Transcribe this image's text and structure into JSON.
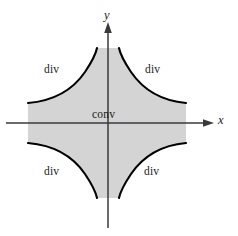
{
  "figure": {
    "type": "math-region-diagram",
    "width": 238,
    "height": 236,
    "background_color": "#ffffff"
  },
  "axes": {
    "x_label": "x",
    "y_label": "y",
    "origin": {
      "x": 108,
      "y": 123
    },
    "axis_color": "#3a3a3a",
    "x_axis": {
      "start_x": 6,
      "end_x": 214,
      "y": 123,
      "arrow": "right"
    },
    "y_axis": {
      "start_y": 228,
      "end_y": 22,
      "x": 108,
      "arrow": "up"
    }
  },
  "regions": {
    "convergent": {
      "label": "conv",
      "fill_color": "#d4d4d4",
      "border_color": "#000000",
      "description": "Shaded region bounded by hyperbolas, containing the origin"
    },
    "divergent": [
      {
        "label": "div",
        "quadrant": "top-left"
      },
      {
        "label": "div",
        "quadrant": "top-right"
      },
      {
        "label": "div",
        "quadrant": "bottom-left"
      },
      {
        "label": "div",
        "quadrant": "bottom-right"
      }
    ]
  },
  "curves": {
    "stroke_color": "#000000",
    "stroke_width": 2.0,
    "count": 4,
    "shape": "hyperbolic-asymptotic"
  },
  "labels": {
    "div_top_left": "div",
    "div_top_right": "div",
    "div_bottom_left": "div",
    "div_bottom_right": "div",
    "conv_center": "conv"
  }
}
